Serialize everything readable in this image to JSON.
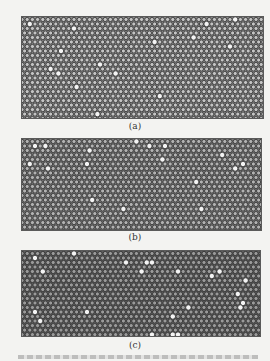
{
  "figure": {
    "panels": [
      {
        "id": "a",
        "label": "(a)",
        "description": "hexagonal close-packed array of particles, mostly ordered with scattered grain boundaries",
        "background_color": "#8a8a8a",
        "particle_color": "#c4c4c4",
        "bounds": {
          "x": 21,
          "y": 16,
          "w": 241,
          "h": 101
        }
      },
      {
        "id": "b",
        "label": "(b)",
        "description": "hexagonal particle lattice with a few bright defect sites and a diagonal dislocation",
        "background_color": "#7a7a7a",
        "particle_color": "#b2b2b2",
        "bounds": {
          "x": 21,
          "y": 138,
          "w": 239,
          "h": 91
        }
      },
      {
        "id": "c",
        "label": "(c)",
        "description": "darker hexagonal particle lattice with bright point defects and a disordered region at right",
        "background_color": "#5e5e5e",
        "particle_color": "#9a9a9a",
        "bounds": {
          "x": 21,
          "y": 250,
          "w": 238,
          "h": 85
        }
      }
    ]
  }
}
